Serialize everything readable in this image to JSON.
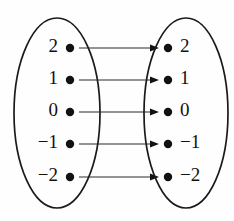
{
  "diagram": {
    "kind": "mapping-diagram",
    "colors": {
      "background": "#fefefe",
      "stroke": "#1a1a1a",
      "dot": "#121212",
      "arrow": "#2a2a2a",
      "text": "#111111"
    },
    "domain_set": {
      "name": "domain-set",
      "ellipse": {
        "cx": 57,
        "cy": 113,
        "rx": 43,
        "ry": 95
      },
      "label_side": "left",
      "elements": [
        {
          "label": "2",
          "dot_x": 70,
          "dot_y": 48,
          "label_x": 58,
          "label_y": 48
        },
        {
          "label": "1",
          "dot_x": 70,
          "dot_y": 80,
          "label_x": 58,
          "label_y": 80
        },
        {
          "label": "0",
          "dot_x": 70,
          "dot_y": 112,
          "label_x": 58,
          "label_y": 112
        },
        {
          "label": "−1",
          "dot_x": 70,
          "dot_y": 144,
          "label_x": 58,
          "label_y": 144
        },
        {
          "label": "−2",
          "dot_x": 70,
          "dot_y": 177,
          "label_x": 58,
          "label_y": 177
        }
      ]
    },
    "codomain_set": {
      "name": "codomain-set",
      "ellipse": {
        "cx": 186,
        "cy": 113,
        "rx": 42,
        "ry": 95
      },
      "label_side": "right",
      "elements": [
        {
          "label": "2",
          "dot_x": 168,
          "dot_y": 48,
          "label_x": 180,
          "label_y": 48
        },
        {
          "label": "1",
          "dot_x": 168,
          "dot_y": 80,
          "label_x": 180,
          "label_y": 80
        },
        {
          "label": "0",
          "dot_x": 168,
          "dot_y": 112,
          "label_x": 180,
          "label_y": 112
        },
        {
          "label": "−1",
          "dot_x": 168,
          "dot_y": 144,
          "label_x": 180,
          "label_y": 144
        },
        {
          "label": "−2",
          "dot_x": 168,
          "dot_y": 177,
          "label_x": 180,
          "label_y": 177
        }
      ]
    },
    "mappings": [
      {
        "from": "2",
        "to": "2",
        "x1": 79,
        "y1": 48,
        "x2": 159,
        "y2": 48
      },
      {
        "from": "1",
        "to": "1",
        "x1": 79,
        "y1": 80,
        "x2": 159,
        "y2": 80
      },
      {
        "from": "0",
        "to": "0",
        "x1": 79,
        "y1": 112,
        "x2": 159,
        "y2": 112
      },
      {
        "from": "−1",
        "to": "−1",
        "x1": 79,
        "y1": 144,
        "x2": 159,
        "y2": 144
      },
      {
        "from": "−2",
        "to": "−2",
        "x1": 79,
        "y1": 177,
        "x2": 159,
        "y2": 177
      }
    ],
    "dot_radius": 4.2
  }
}
